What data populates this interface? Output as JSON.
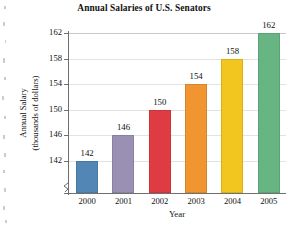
{
  "chart_data": {
    "type": "bar",
    "title": "Annual Salaries of U.S. Senators",
    "xlabel": "Year",
    "ylabel_line1": "Annual Salary",
    "ylabel_line2": "(thousands of dollars)",
    "categories": [
      "2000",
      "2001",
      "2002",
      "2003",
      "2004",
      "2005"
    ],
    "values": [
      142,
      146,
      150,
      154,
      158,
      162
    ],
    "value_labels": [
      "142",
      "146",
      "150",
      "154",
      "158",
      "162"
    ],
    "yticks": [
      142,
      146,
      150,
      154,
      158,
      162
    ],
    "ytick_labels": [
      "142",
      "146",
      "150",
      "154",
      "158",
      "162"
    ],
    "ylim": [
      140,
      162
    ],
    "axis_break": true,
    "grid": true,
    "legend": "none",
    "bar_colors": [
      "#5286b4",
      "#9a90b4",
      "#df3b43",
      "#f0952f",
      "#f2c51f",
      "#67b583"
    ]
  }
}
